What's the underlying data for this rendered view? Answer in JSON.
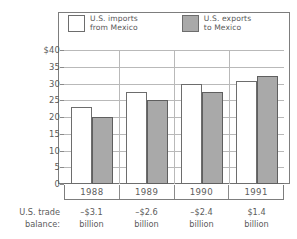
{
  "legend": {
    "entries": [
      {
        "label_line1": "U.S. imports",
        "label_line2": "from Mexico",
        "swatch": "white",
        "color": "#ffffff"
      },
      {
        "label_line1": "U.S. exports",
        "label_line2": "to Mexico",
        "swatch": "gray",
        "color": "#a9a9a9"
      }
    ]
  },
  "axis": {
    "ticks": [
      "$40",
      "35",
      "30",
      "25",
      "20",
      "15",
      "10",
      "5",
      "0"
    ]
  },
  "balance": {
    "label_line1": "U.S. trade",
    "label_line2": "balance:",
    "values": [
      {
        "amount": "–$3.1",
        "unit": "billion"
      },
      {
        "amount": "–$2.6",
        "unit": "billion"
      },
      {
        "amount": "–$2.4",
        "unit": "billion"
      },
      {
        "amount": "$1.4",
        "unit": "billion"
      }
    ]
  },
  "chart_data": {
    "type": "bar",
    "title": "",
    "xlabel": "",
    "ylabel": "",
    "categories": [
      "1988",
      "1989",
      "1990",
      "1991"
    ],
    "series": [
      {
        "name": "U.S. imports from Mexico",
        "color": "#ffffff",
        "values": [
          23.0,
          27.5,
          30.0,
          30.9
        ]
      },
      {
        "name": "U.S. exports to Mexico",
        "color": "#a9a9a9",
        "values": [
          20.0,
          25.0,
          27.5,
          32.3
        ]
      }
    ],
    "ylim": [
      0,
      40
    ],
    "ytick_values": [
      40,
      35,
      30,
      25,
      20,
      15,
      10,
      5,
      0
    ],
    "ytick_labels": [
      "$40",
      "35",
      "30",
      "25",
      "20",
      "15",
      "10",
      "5",
      "0"
    ],
    "grid": true,
    "legend_position": "top-inside",
    "annotations": {
      "U.S. trade balance:": [
        "–$3.1 billion",
        "–$2.6 billion",
        "–$2.4 billion",
        "$1.4 billion"
      ]
    }
  }
}
